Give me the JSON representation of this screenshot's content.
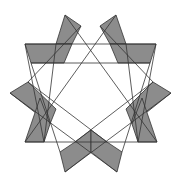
{
  "figure": {
    "type": "geometric-star",
    "colors": {
      "background": "#ffffff",
      "fill": "#8c8c8c",
      "stroke": "#333333"
    },
    "shaded_polygons": [
      {
        "name": "top-left-spike",
        "points": "65,15 81,26 72,44 56,44"
      },
      {
        "name": "top-right-spike",
        "points": "116,15 100,26 110,44 126,44"
      },
      {
        "name": "left-top-band",
        "points": "25,44 72,44 64,63 31,63"
      },
      {
        "name": "right-top-band",
        "points": "110,44 156,44 150,63 118,63"
      },
      {
        "name": "left-spike",
        "points": "10,93 28,82 56,109 50,124"
      },
      {
        "name": "right-spike",
        "points": "171,93 153,82 126,109 132,124"
      },
      {
        "name": "left-lower-band",
        "points": "40,98 50,124 44,142 25,142"
      },
      {
        "name": "right-lower-band",
        "points": "142,98 132,124 138,142 157,142"
      },
      {
        "name": "bottom-left-spike",
        "points": "75,142 91,130 91,152 65,172 60,152"
      },
      {
        "name": "bottom-right-spike",
        "points": "107,142 91,130 91,152 117,172 122,152"
      }
    ],
    "lines": [
      {
        "name": "top-horizontal-1",
        "x1": 25,
        "y1": 44,
        "x2": 156,
        "y2": 44
      },
      {
        "name": "top-horizontal-2",
        "x1": 31,
        "y1": 63,
        "x2": 150,
        "y2": 63
      },
      {
        "name": "bottom-horizontal",
        "x1": 25,
        "y1": 142,
        "x2": 157,
        "y2": 142
      },
      {
        "name": "diag-a",
        "x1": 65,
        "y1": 15,
        "x2": 157,
        "y2": 142
      },
      {
        "name": "diag-b",
        "x1": 116,
        "y1": 15,
        "x2": 25,
        "y2": 142
      },
      {
        "name": "diag-c",
        "x1": 81,
        "y1": 26,
        "x2": 28,
        "y2": 82
      },
      {
        "name": "diag-d",
        "x1": 100,
        "y1": 26,
        "x2": 153,
        "y2": 82
      },
      {
        "name": "diag-e",
        "x1": 25,
        "y1": 44,
        "x2": 44,
        "y2": 142
      },
      {
        "name": "diag-f",
        "x1": 156,
        "y1": 44,
        "x2": 138,
        "y2": 142
      },
      {
        "name": "diag-g",
        "x1": 31,
        "y1": 63,
        "x2": 60,
        "y2": 152
      },
      {
        "name": "diag-h",
        "x1": 150,
        "y1": 63,
        "x2": 122,
        "y2": 152
      },
      {
        "name": "diag-i",
        "x1": 10,
        "y1": 93,
        "x2": 117,
        "y2": 172
      },
      {
        "name": "diag-j",
        "x1": 171,
        "y1": 93,
        "x2": 65,
        "y2": 172
      },
      {
        "name": "diag-k",
        "x1": 28,
        "y1": 82,
        "x2": 107,
        "y2": 142
      },
      {
        "name": "diag-l",
        "x1": 153,
        "y1": 82,
        "x2": 75,
        "y2": 142
      },
      {
        "name": "diag-m",
        "x1": 56,
        "y1": 44,
        "x2": 44,
        "y2": 142
      },
      {
        "name": "diag-n",
        "x1": 126,
        "y1": 44,
        "x2": 138,
        "y2": 142
      }
    ]
  }
}
